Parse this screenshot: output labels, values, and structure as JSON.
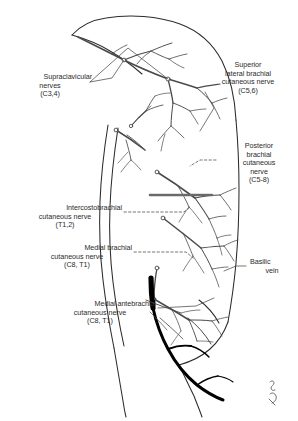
{
  "figure": {
    "ink_color": "#1a1a1a",
    "outline_color": "#2b2b2b",
    "nerve_color": "#4a4a4a",
    "vein_color": "#000000",
    "background": "#ffffff",
    "signature": "artist-monogram"
  },
  "labels": {
    "supraclavicular": {
      "line1": "Supraclavicular",
      "line2": "nerves",
      "line3": "(C3,4)"
    },
    "superior_lateral_brachial": {
      "line1": "Superior",
      "line2": "lateral brachial",
      "line3": "cutaneous nerve",
      "line4": "(C5,6)"
    },
    "posterior_brachial": {
      "line1": "Posterior",
      "line2": "brachial",
      "line3": "cutaneous",
      "line4": "nerve",
      "line5": "(C5-8)"
    },
    "intercostobrachial": {
      "line1": "Intercostobrachial",
      "line2": "cutaneous nerve",
      "line3": "(T1,2)"
    },
    "medial_brachial": {
      "line1": "Medial brachial",
      "line2": "cutaneous nerve",
      "line3": "(C8, T1)"
    },
    "medial_antebrachial": {
      "line1": "Medial antebrachial",
      "line2": "cutaneous nerve",
      "line3": "(C8, T1)"
    },
    "basilic_vein": {
      "line1": "Basilic",
      "line2": "vein"
    }
  }
}
